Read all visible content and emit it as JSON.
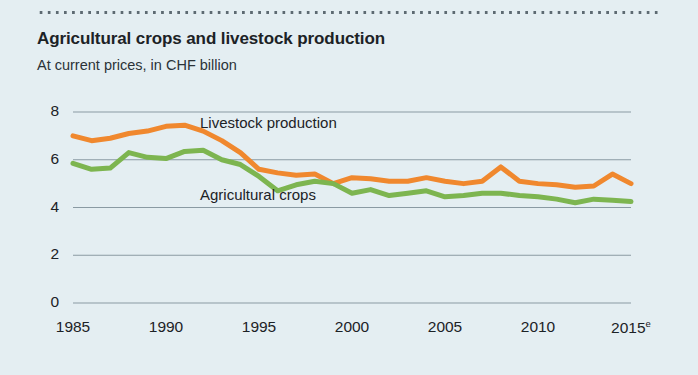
{
  "figure": {
    "title": "Agricultural crops and livestock production",
    "subtitle": "At current prices, in CHF billion",
    "background_color": "#e4eef2",
    "rule_color": "#5d6a72"
  },
  "chart_data": {
    "type": "line",
    "title": "Agricultural crops and livestock production",
    "subtitle": "At current prices, in CHF billion",
    "xlabel": "",
    "ylabel": "CHF billion",
    "xlim": [
      1985,
      2015
    ],
    "ylim": [
      0,
      8.6
    ],
    "yticks": [
      0,
      2,
      4,
      6,
      8
    ],
    "ytick_labels": [
      "0",
      "2",
      "4",
      "6",
      "8"
    ],
    "xticks": [
      1985,
      1990,
      1995,
      2000,
      2005,
      2010,
      2015
    ],
    "xtick_labels": [
      "1985",
      "1990",
      "1995",
      "2000",
      "2005",
      "2010",
      "2015"
    ],
    "xtick_superscripts": [
      "",
      "",
      "",
      "",
      "",
      "",
      "e"
    ],
    "grid": "horizontal",
    "grid_color": "#8a9aa3",
    "legend": "inline-annotations",
    "x": [
      1985,
      1986,
      1987,
      1988,
      1989,
      1990,
      1991,
      1992,
      1993,
      1994,
      1995,
      1996,
      1997,
      1998,
      1999,
      2000,
      2001,
      2002,
      2003,
      2004,
      2005,
      2006,
      2007,
      2008,
      2009,
      2010,
      2011,
      2012,
      2013,
      2014,
      2015
    ],
    "series": [
      {
        "name": "Livestock production",
        "color": "#f0882e",
        "values": [
          7.0,
          6.8,
          6.9,
          7.1,
          7.2,
          7.4,
          7.45,
          7.2,
          6.8,
          6.3,
          5.6,
          5.45,
          5.35,
          5.4,
          5.0,
          5.25,
          5.2,
          5.1,
          5.1,
          5.25,
          5.1,
          5.0,
          5.1,
          5.7,
          5.1,
          5.0,
          4.95,
          4.85,
          4.9,
          5.4,
          5.0
        ]
      },
      {
        "name": "Agricultural crops",
        "color": "#7db550",
        "values": [
          5.85,
          5.6,
          5.65,
          6.3,
          6.1,
          6.05,
          6.35,
          6.4,
          6.0,
          5.8,
          5.3,
          4.7,
          4.95,
          5.1,
          5.0,
          4.6,
          4.75,
          4.5,
          4.6,
          4.7,
          4.45,
          4.5,
          4.6,
          4.6,
          4.5,
          4.45,
          4.35,
          4.2,
          4.35,
          4.3,
          4.25
        ]
      }
    ],
    "annotations": [
      {
        "text": "Livestock production",
        "x_px": 200,
        "y_px": 124
      },
      {
        "text": "Agricultural crops",
        "x_px": 200,
        "y_px": 196
      }
    ]
  }
}
